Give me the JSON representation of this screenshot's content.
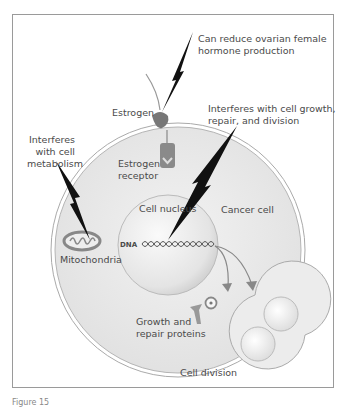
{
  "diagram": {
    "labels": {
      "ovarian": [
        "Can reduce ovarian female",
        "hormone production"
      ],
      "estrogen": "Estrogen",
      "growth_interfere": [
        "Interferes with cell growth,",
        "repair, and division"
      ],
      "metabolism": [
        "Interferes",
        "with cell",
        "metabolism"
      ],
      "receptor": [
        "Estrogen",
        "receptor"
      ],
      "nucleus": "Cell nucleus",
      "cancer_cell": "Cancer cell",
      "dna": "DNA",
      "mitochondria": "Mitochondria",
      "proteins": [
        "Growth and",
        "repair proteins"
      ],
      "division": "Cell division"
    },
    "caption": "Figure 15"
  }
}
